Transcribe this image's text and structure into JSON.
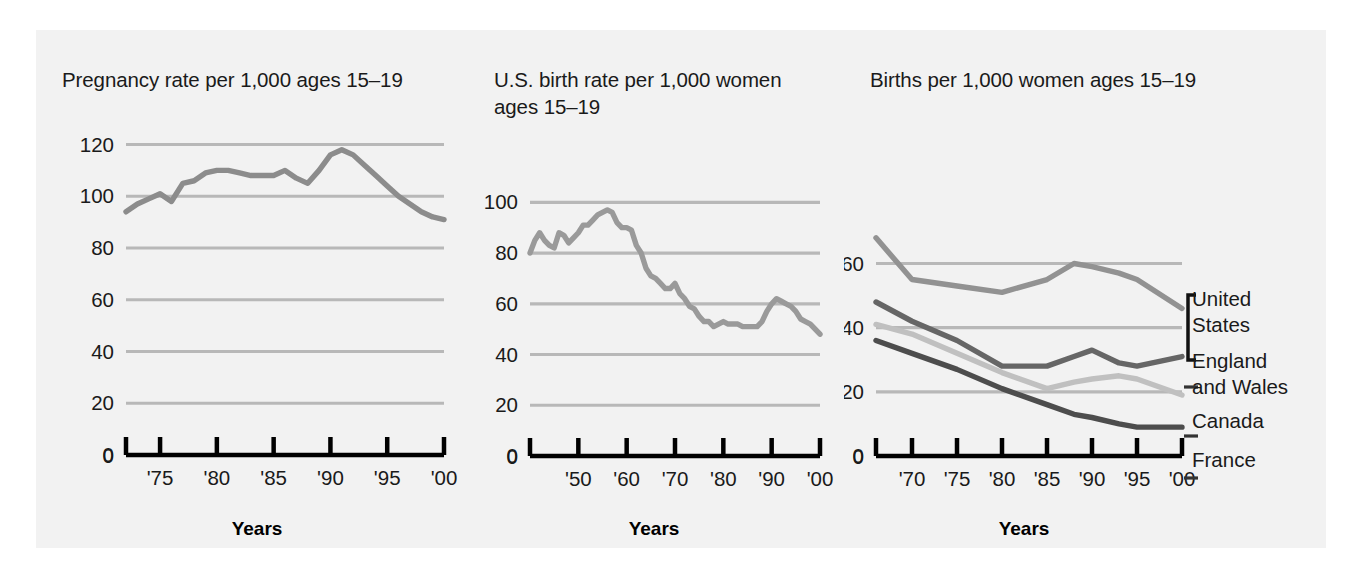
{
  "figure": {
    "background": "#f2f2f2",
    "page_background": "#ffffff"
  },
  "charts": [
    {
      "id": "pregnancy-rate",
      "title": "Pregnancy rate per 1,000 ages 15–19",
      "xlabel": "Years",
      "yticks": [
        "0",
        "20",
        "40",
        "60",
        "80",
        "100",
        "120"
      ],
      "xticks": [
        "'75",
        "'80",
        "'85",
        "'90",
        "'95",
        "'00"
      ],
      "color": "#8c8c8c"
    },
    {
      "id": "us-birth-rate",
      "title": "U.S. birth rate per 1,000 women\nages 15–19",
      "xlabel": "Years",
      "yticks": [
        "0",
        "20",
        "40",
        "60",
        "80",
        "100"
      ],
      "xticks": [
        "'50",
        "'60",
        "'70",
        "'80",
        "'90",
        "'00"
      ],
      "color": "#9a9a9a"
    },
    {
      "id": "births-by-country",
      "title": "Births per 1,000 women ages 15–19",
      "xlabel": "Years",
      "yticks": [
        "0",
        "20",
        "40",
        "60"
      ],
      "xticks": [
        "'70",
        "'75",
        "'80",
        "'85",
        "'90",
        "'95",
        "'00"
      ],
      "legend": [
        {
          "label": "United\nStates",
          "color": "#929292",
          "marker": "bracket"
        },
        {
          "label": "England\nand Wales",
          "color": "#666666",
          "marker": "dash"
        },
        {
          "label": "Canada",
          "color": "#c0c0c0",
          "marker": "dash"
        },
        {
          "label": "France",
          "color": "#4d4d4d",
          "marker": "dash"
        }
      ]
    }
  ],
  "chart_data": [
    {
      "type": "line",
      "title": "Pregnancy rate per 1,000 ages 15–19",
      "xlabel": "Years",
      "ylabel": "",
      "xlim": [
        1972,
        2000
      ],
      "ylim": [
        0,
        126
      ],
      "grid": true,
      "legend": "none",
      "xticks": [
        1975,
        1980,
        1985,
        1990,
        1995,
        2000
      ],
      "xticklabels": [
        "'75",
        "'80",
        "'85",
        "'90",
        "'95",
        "'00"
      ],
      "yticks": [
        0,
        20,
        40,
        60,
        80,
        100,
        120
      ],
      "series": [
        {
          "name": "Pregnancy rate ages 15-19",
          "color": "#8c8c8c",
          "x": [
            1972,
            1973,
            1974,
            1975,
            1976,
            1977,
            1978,
            1979,
            1980,
            1981,
            1982,
            1983,
            1984,
            1985,
            1986,
            1987,
            1988,
            1989,
            1990,
            1991,
            1992,
            1993,
            1994,
            1995,
            1996,
            1997,
            1998,
            1999,
            2000
          ],
          "values": [
            94,
            97,
            99,
            101,
            98,
            105,
            106,
            109,
            110,
            110,
            109,
            108,
            108,
            108,
            110,
            107,
            105,
            110,
            116,
            118,
            116,
            112,
            108,
            104,
            100,
            97,
            94,
            92,
            91
          ]
        }
      ]
    },
    {
      "type": "line",
      "title": "U.S. birth rate per 1,000 women ages 15–19",
      "xlabel": "Years",
      "ylabel": "",
      "xlim": [
        1940,
        2000
      ],
      "ylim": [
        0,
        108
      ],
      "grid": true,
      "legend": "none",
      "xticks": [
        1950,
        1960,
        1970,
        1980,
        1990,
        2000
      ],
      "xticklabels": [
        "'50",
        "'60",
        "'70",
        "'80",
        "'90",
        "'00"
      ],
      "yticks": [
        0,
        20,
        40,
        60,
        80,
        100
      ],
      "series": [
        {
          "name": "U.S. birth rate ages 15-19",
          "color": "#9a9a9a",
          "x": [
            1940,
            1941,
            1942,
            1943,
            1944,
            1945,
            1946,
            1947,
            1948,
            1949,
            1950,
            1951,
            1952,
            1953,
            1954,
            1955,
            1956,
            1957,
            1958,
            1959,
            1960,
            1961,
            1962,
            1963,
            1964,
            1965,
            1966,
            1967,
            1968,
            1969,
            1970,
            1971,
            1972,
            1973,
            1974,
            1975,
            1976,
            1977,
            1978,
            1979,
            1980,
            1981,
            1982,
            1983,
            1984,
            1985,
            1986,
            1987,
            1988,
            1989,
            1990,
            1991,
            1992,
            1993,
            1994,
            1995,
            1996,
            1997,
            1998,
            1999,
            2000
          ],
          "values": [
            80,
            85,
            88,
            85,
            83,
            82,
            88,
            87,
            84,
            86,
            88,
            91,
            91,
            93,
            95,
            96,
            97,
            96,
            92,
            90,
            90,
            89,
            83,
            80,
            74,
            71,
            70,
            68,
            66,
            66,
            68,
            64,
            62,
            59,
            58,
            55,
            53,
            53,
            51,
            52,
            53,
            52,
            52,
            52,
            51,
            51,
            51,
            51,
            53,
            57,
            60,
            62,
            61,
            60,
            59,
            57,
            54,
            53,
            52,
            50,
            48
          ]
        }
      ]
    },
    {
      "type": "line",
      "title": "Births per 1,000 women ages 15–19",
      "xlabel": "Years",
      "ylabel": "",
      "xlim": [
        1966,
        2000
      ],
      "ylim": [
        0,
        72
      ],
      "grid": true,
      "legend": "right",
      "xticks": [
        1970,
        1975,
        1980,
        1985,
        1990,
        1995,
        2000
      ],
      "xticklabels": [
        "'70",
        "'75",
        "'80",
        "'85",
        "'90",
        "'95",
        "'00"
      ],
      "yticks": [
        0,
        20,
        40,
        60
      ],
      "series": [
        {
          "name": "United States",
          "color": "#929292",
          "x": [
            1966,
            1970,
            1975,
            1980,
            1985,
            1988,
            1990,
            1993,
            1995,
            2000
          ],
          "values": [
            68,
            55,
            53,
            51,
            55,
            60,
            59,
            57,
            55,
            46
          ]
        },
        {
          "name": "England and Wales",
          "color": "#666666",
          "x": [
            1966,
            1970,
            1975,
            1980,
            1985,
            1988,
            1990,
            1993,
            1995,
            2000
          ],
          "values": [
            48,
            42,
            36,
            28,
            28,
            31,
            33,
            29,
            28,
            31
          ]
        },
        {
          "name": "Canada",
          "color": "#c0c0c0",
          "x": [
            1966,
            1970,
            1975,
            1980,
            1985,
            1988,
            1990,
            1993,
            1995,
            2000
          ],
          "values": [
            41,
            38,
            32,
            26,
            21,
            23,
            24,
            25,
            24,
            19
          ]
        },
        {
          "name": "France",
          "color": "#4d4d4d",
          "x": [
            1966,
            1970,
            1975,
            1980,
            1985,
            1988,
            1990,
            1993,
            1995,
            2000
          ],
          "values": [
            36,
            32,
            27,
            21,
            16,
            13,
            12,
            10,
            9,
            9
          ]
        }
      ]
    }
  ]
}
